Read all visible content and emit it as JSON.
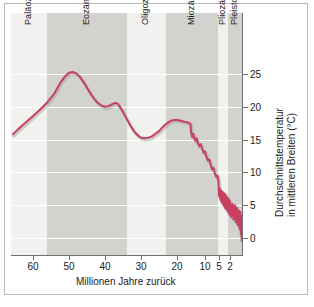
{
  "figure": {
    "background_color": "#ffffff",
    "frame_color": "#b9b9b9"
  },
  "chart_data": {
    "type": "line",
    "title": "",
    "subtitle": "",
    "xlabel": "Millionen Jahre zurück",
    "ylabel": "Durchschnittstemperatur in mittleren Breiten (°C)",
    "ylabel_line1": "Durchschnittstemperatur",
    "ylabel_line2": "in mittleren Breiten (°C)",
    "grid": "horizontal",
    "legend_position": "none",
    "xlim": [
      66,
      0
    ],
    "ylim": [
      -2,
      27
    ],
    "x_axis_scale": "compressed-recent",
    "xticks": [
      60,
      50,
      40,
      30,
      20,
      10,
      5,
      2
    ],
    "xtick_labels": [
      "60",
      "50",
      "40",
      "30",
      "20",
      "10",
      "5",
      "2"
    ],
    "yticks": [
      0,
      5,
      10,
      15,
      20,
      25
    ],
    "ytick_labels": [
      "0",
      "5",
      "10",
      "15",
      "20",
      "25"
    ],
    "line_color": "#c8405e",
    "line_width": 2,
    "series": [
      {
        "name": "Durchschnittstemperatur",
        "points": [
          [
            65.5,
            15.8
          ],
          [
            64,
            16.6
          ],
          [
            62,
            17.6
          ],
          [
            60,
            18.6
          ],
          [
            58,
            19.6
          ],
          [
            56,
            20.7
          ],
          [
            54,
            22.1
          ],
          [
            52.5,
            23.6
          ],
          [
            51,
            24.7
          ],
          [
            50,
            25.2
          ],
          [
            49,
            25.3
          ],
          [
            48,
            25.1
          ],
          [
            47,
            24.6
          ],
          [
            46,
            23.8
          ],
          [
            45,
            22.9
          ],
          [
            44,
            22.0
          ],
          [
            43,
            21.2
          ],
          [
            42,
            20.6
          ],
          [
            41,
            20.2
          ],
          [
            40,
            20.0
          ],
          [
            39,
            20.1
          ],
          [
            38,
            20.4
          ],
          [
            37.2,
            20.6
          ],
          [
            36.5,
            20.5
          ],
          [
            36,
            20.1
          ],
          [
            35,
            19.2
          ],
          [
            34,
            18.2
          ],
          [
            33,
            17.2
          ],
          [
            32,
            16.3
          ],
          [
            31,
            15.7
          ],
          [
            30,
            15.3
          ],
          [
            29,
            15.2
          ],
          [
            28,
            15.3
          ],
          [
            27,
            15.5
          ],
          [
            26,
            15.9
          ],
          [
            25,
            16.3
          ],
          [
            24,
            16.9
          ],
          [
            23,
            17.4
          ],
          [
            22,
            17.8
          ],
          [
            21,
            18.0
          ],
          [
            20,
            18.0
          ],
          [
            19,
            17.9
          ],
          [
            18,
            17.8
          ],
          [
            17,
            17.7
          ],
          [
            16,
            17.6
          ],
          [
            15.2,
            17.4
          ],
          [
            15.0,
            16.2
          ],
          [
            14.6,
            15.4
          ],
          [
            14.2,
            15.9
          ],
          [
            13.8,
            15.2
          ],
          [
            13.4,
            14.8
          ],
          [
            13.0,
            15.2
          ],
          [
            12.5,
            14.4
          ],
          [
            12.0,
            14.0
          ],
          [
            11.5,
            14.3
          ],
          [
            11.0,
            13.6
          ],
          [
            10.5,
            13.0
          ],
          [
            10.0,
            13.2
          ],
          [
            9.5,
            12.4
          ],
          [
            9.0,
            11.8
          ],
          [
            8.5,
            12.0
          ],
          [
            8.0,
            11.2
          ],
          [
            7.5,
            10.5
          ],
          [
            7.0,
            10.7
          ],
          [
            6.5,
            9.9
          ],
          [
            6.0,
            9.3
          ],
          [
            5.5,
            9.5
          ],
          [
            5.2,
            8.6
          ],
          [
            5.0,
            6.4
          ],
          [
            4.8,
            7.6
          ],
          [
            4.6,
            5.8
          ],
          [
            4.4,
            7.2
          ],
          [
            4.2,
            5.4
          ],
          [
            4.0,
            7.0
          ],
          [
            3.8,
            5.0
          ],
          [
            3.6,
            6.8
          ],
          [
            3.4,
            4.6
          ],
          [
            3.2,
            6.6
          ],
          [
            3.0,
            4.4
          ],
          [
            2.8,
            6.2
          ],
          [
            2.6,
            4.0
          ],
          [
            2.4,
            6.0
          ],
          [
            2.2,
            3.6
          ],
          [
            2.0,
            5.6
          ],
          [
            1.8,
            3.2
          ],
          [
            1.6,
            5.2
          ],
          [
            1.4,
            2.8
          ],
          [
            1.2,
            5.0
          ],
          [
            1.0,
            2.4
          ],
          [
            0.85,
            4.6
          ],
          [
            0.7,
            2.0
          ],
          [
            0.55,
            4.2
          ],
          [
            0.42,
            1.4
          ],
          [
            0.3,
            4.0
          ],
          [
            0.2,
            0.6
          ],
          [
            0.12,
            3.4
          ],
          [
            0.05,
            -0.4
          ],
          [
            0.0,
            2.8
          ]
        ]
      }
    ],
    "epochs": [
      {
        "label": "Paläozän",
        "start": 66,
        "end": 56,
        "shade": "light"
      },
      {
        "label": "Eozän",
        "start": 56,
        "end": 34,
        "shade": "dark"
      },
      {
        "label": "Oligozän",
        "start": 34,
        "end": 23,
        "shade": "light"
      },
      {
        "label": "Miozän",
        "start": 23,
        "end": 5.3,
        "shade": "dark"
      },
      {
        "label": "Pliozän",
        "start": 5.3,
        "end": 2.6,
        "shade": "light"
      },
      {
        "label": "Pleistozän",
        "start": 2.6,
        "end": 0,
        "shade": "dark"
      }
    ]
  }
}
